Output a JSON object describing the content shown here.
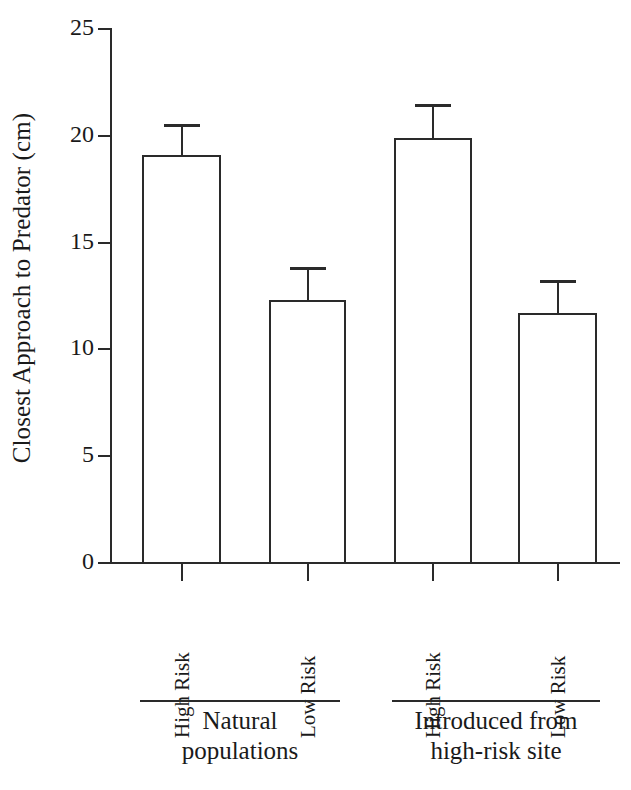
{
  "chart_data": {
    "type": "bar",
    "title": "",
    "subtitle": "",
    "xlabel": "",
    "ylabel": "Closest Approach to Predator (cm)",
    "ylim": [
      0,
      25
    ],
    "yticks": [
      0,
      5,
      10,
      15,
      20,
      25
    ],
    "ytick_labels": [
      "0",
      "5",
      "10",
      "15",
      "20",
      "25"
    ],
    "grid": false,
    "legend": null,
    "legend_position": "none",
    "categories": [
      "High Risk",
      "Low Risk",
      "High Risk",
      "Low Risk"
    ],
    "values": [
      19.1,
      12.3,
      19.9,
      11.7
    ],
    "errors": [
      1.45,
      1.55,
      1.6,
      1.55
    ],
    "error_type": "upper-only",
    "bar_style": {
      "fill": "#ffffff",
      "edge": "#2a2a2a",
      "edge_width": 2
    },
    "groups": [
      {
        "label_lines": [
          "Natural",
          "populations"
        ],
        "label": "Natural populations",
        "members": [
          "High Risk",
          "Low Risk"
        ]
      },
      {
        "label_lines": [
          "Introduced from",
          "high-risk site"
        ],
        "label": "Introduced from high-risk site",
        "members": [
          "High Risk",
          "Low Risk"
        ]
      }
    ],
    "bars": [
      {
        "group": "Natural populations",
        "category": "High Risk",
        "value": 19.1,
        "error_upper": 1.45,
        "error_top_value": 20.55
      },
      {
        "group": "Natural populations",
        "category": "Low Risk",
        "value": 12.3,
        "error_upper": 1.55,
        "error_top_value": 13.85
      },
      {
        "group": "Introduced from high-risk site",
        "category": "High Risk",
        "value": 19.9,
        "error_upper": 1.6,
        "error_top_value": 21.5
      },
      {
        "group": "Introduced from high-risk site",
        "category": "Low Risk",
        "value": 11.7,
        "error_upper": 1.55,
        "error_top_value": 13.25
      }
    ]
  },
  "colors": {
    "ink": "#2a2a2a",
    "background": "#ffffff",
    "bar_fill": "#ffffff"
  }
}
